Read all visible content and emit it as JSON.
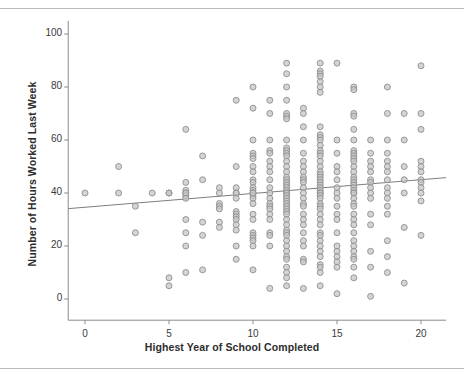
{
  "figure": {
    "background_color": "#ffffff",
    "frame_color": "#b9b9b9"
  },
  "chart_data": {
    "type": "scatter",
    "title": "",
    "subtitle": "",
    "xlabel": "Highest Year of School Completed",
    "ylabel": "Number of Hours Worked Last Week",
    "xlim": [
      -1,
      21.5
    ],
    "ylim": [
      -8,
      105
    ],
    "xticks": [
      0,
      5,
      10,
      15,
      20
    ],
    "xticklabels": [
      "0",
      "5",
      "10",
      "15",
      "20"
    ],
    "yticks": [
      0,
      20,
      40,
      60,
      80,
      100
    ],
    "yticklabels": [
      "0",
      "20",
      "40",
      "60",
      "80",
      "100"
    ],
    "grid": false,
    "legend": null,
    "marker": {
      "shape": "circle",
      "fill_color": "#c6c6c6",
      "edge_color": "#8f8f8f",
      "diameter_px": 6,
      "opacity": 0.75
    },
    "fit_line": {
      "label": "linear regression fit",
      "color": "#7d7d7d",
      "width_px": 1,
      "intercept": 34.6,
      "slope": 0.52,
      "x_start": -1,
      "x_end": 21.5,
      "y_start": 34.1,
      "y_end": 45.8
    },
    "x": [
      0,
      2,
      2,
      3,
      3,
      4,
      5,
      5,
      5,
      5,
      6,
      6,
      6,
      6,
      6,
      6,
      6,
      6,
      6,
      6,
      6,
      7,
      7,
      7,
      7,
      7,
      8,
      8,
      8,
      8,
      8,
      8,
      8,
      9,
      9,
      9,
      9,
      9,
      9,
      9,
      9,
      9,
      9,
      9,
      9,
      9,
      9,
      10,
      10,
      10,
      10,
      10,
      10,
      10,
      10,
      10,
      10,
      10,
      10,
      10,
      10,
      10,
      10,
      10,
      10,
      10,
      10,
      10,
      10,
      10,
      10,
      10,
      10,
      11,
      11,
      11,
      11,
      11,
      11,
      11,
      11,
      11,
      11,
      11,
      11,
      11,
      11,
      11,
      11,
      11,
      11,
      11,
      11,
      11,
      12,
      12,
      12,
      12,
      12,
      12,
      12,
      12,
      12,
      12,
      12,
      12,
      12,
      12,
      12,
      12,
      12,
      12,
      12,
      12,
      12,
      12,
      12,
      12,
      12,
      12,
      12,
      12,
      12,
      12,
      12,
      12,
      12,
      12,
      12,
      12,
      12,
      12,
      12,
      12,
      12,
      12,
      12,
      12,
      12,
      13,
      13,
      13,
      13,
      13,
      13,
      13,
      13,
      13,
      13,
      13,
      13,
      13,
      13,
      13,
      13,
      13,
      13,
      13,
      13,
      13,
      13,
      13,
      13,
      13,
      14,
      14,
      14,
      14,
      14,
      14,
      14,
      14,
      14,
      14,
      14,
      14,
      14,
      14,
      14,
      14,
      14,
      14,
      14,
      14,
      14,
      14,
      14,
      14,
      14,
      14,
      14,
      14,
      14,
      14,
      14,
      14,
      14,
      14,
      14,
      14,
      14,
      14,
      14,
      14,
      14,
      14,
      14,
      14,
      14,
      15,
      15,
      15,
      15,
      15,
      15,
      15,
      15,
      15,
      15,
      15,
      15,
      15,
      15,
      15,
      15,
      15,
      15,
      15,
      16,
      16,
      16,
      16,
      16,
      16,
      16,
      16,
      16,
      16,
      16,
      16,
      16,
      16,
      16,
      16,
      16,
      16,
      16,
      16,
      16,
      16,
      16,
      16,
      16,
      16,
      16,
      16,
      16,
      16,
      16,
      16,
      16,
      16,
      16,
      17,
      17,
      17,
      17,
      17,
      17,
      17,
      17,
      17,
      17,
      17,
      17,
      17,
      17,
      17,
      18,
      18,
      18,
      18,
      18,
      18,
      18,
      18,
      18,
      18,
      18,
      18,
      18,
      18,
      18,
      18,
      19,
      19,
      19,
      19,
      19,
      19,
      19,
      20,
      20,
      20,
      20,
      20,
      20,
      20,
      20,
      20,
      20,
      20,
      20
    ],
    "y": [
      40,
      50,
      40,
      35,
      25,
      40,
      40,
      40,
      8,
      5,
      64,
      44,
      41,
      40,
      39,
      30,
      25,
      20,
      10,
      40,
      38,
      54,
      45,
      29,
      24,
      11,
      42,
      40,
      36,
      35,
      34,
      29,
      27,
      75,
      50,
      42,
      40,
      40,
      38,
      33,
      32,
      31,
      30,
      28,
      26,
      20,
      15,
      80,
      72,
      60,
      55,
      54,
      53,
      50,
      48,
      45,
      44,
      42,
      41,
      40,
      40,
      39,
      38,
      36,
      32,
      30,
      25,
      24,
      23,
      22,
      20,
      11,
      40,
      75,
      70,
      60,
      56,
      55,
      52,
      50,
      48,
      45,
      42,
      40,
      38,
      36,
      35,
      34,
      32,
      30,
      25,
      24,
      20,
      4,
      89,
      85,
      80,
      75,
      70,
      69,
      68,
      60,
      57,
      56,
      55,
      54,
      52,
      50,
      48,
      46,
      45,
      44,
      43,
      42,
      41,
      40,
      40,
      39,
      38,
      37,
      36,
      35,
      34,
      33,
      32,
      30,
      28,
      26,
      25,
      24,
      22,
      20,
      18,
      16,
      15,
      12,
      10,
      8,
      5,
      4,
      72,
      70,
      65,
      60,
      55,
      52,
      50,
      48,
      46,
      45,
      44,
      42,
      40,
      38,
      36,
      35,
      32,
      30,
      28,
      25,
      22,
      20,
      15,
      14,
      13,
      89,
      86,
      85,
      84,
      82,
      80,
      78,
      65,
      62,
      61,
      60,
      58,
      56,
      55,
      54,
      52,
      50,
      48,
      47,
      46,
      45,
      44,
      43,
      42,
      41,
      40,
      40,
      39,
      38,
      36,
      35,
      34,
      32,
      30,
      28,
      25,
      24,
      22,
      20,
      18,
      16,
      12,
      10,
      5,
      2,
      89,
      60,
      55,
      50,
      48,
      45,
      42,
      40,
      38,
      35,
      32,
      30,
      25,
      20,
      18,
      16,
      14,
      12,
      8,
      80,
      79,
      70,
      69,
      64,
      60,
      56,
      55,
      54,
      53,
      52,
      50,
      48,
      46,
      45,
      44,
      43,
      42,
      41,
      40,
      40,
      38,
      36,
      35,
      32,
      30,
      28,
      25,
      22,
      20,
      18,
      16,
      15,
      12,
      1,
      60,
      55,
      52,
      50,
      48,
      45,
      44,
      42,
      40,
      38,
      32,
      28,
      18,
      12,
      10,
      80,
      70,
      60,
      55,
      52,
      50,
      48,
      45,
      42,
      40,
      38,
      35,
      32,
      22,
      16,
      6,
      70,
      60,
      50,
      45,
      40,
      27,
      24,
      88,
      70,
      64,
      52,
      50,
      48,
      45,
      44,
      42,
      40,
      37,
      20,
      4
    ]
  }
}
